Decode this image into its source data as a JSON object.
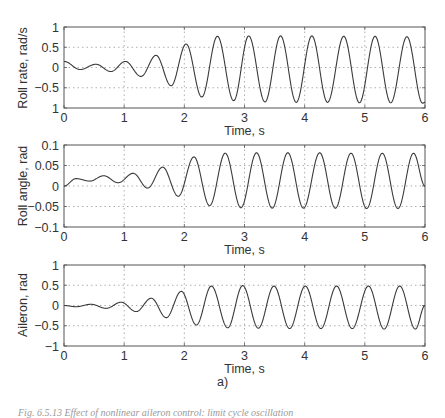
{
  "figure": {
    "subfigure_label": "a)",
    "caption": "Fig. 6.5.13 Effect of nonlinear aileron control: limit cycle oscillation"
  },
  "chart_data": [
    {
      "type": "line",
      "title": "",
      "xlabel": "Time, s",
      "ylabel": "Roll rate, rad/s",
      "xlim": [
        0,
        6
      ],
      "ylim": [
        -1,
        1
      ],
      "xticks": [
        "0",
        "1",
        "2",
        "3",
        "4",
        "5",
        "6"
      ],
      "yticks": [
        "1",
        "0.5",
        "0",
        "−0.5",
        "1"
      ],
      "ytick_values": [
        1,
        0.5,
        0,
        -0.5,
        -1
      ],
      "grid": true,
      "series": [
        {
          "name": "Roll rate",
          "extrema_t": [
            0,
            0.27,
            0.53,
            0.78,
            1.02,
            1.28,
            1.53,
            1.78,
            2.03,
            2.29,
            2.55,
            2.82,
            3.07,
            3.34,
            3.6,
            3.86,
            4.12,
            4.38,
            4.65,
            4.91,
            5.17,
            5.43,
            5.7,
            5.96,
            6.0
          ],
          "extrema_v": [
            0.15,
            -0.05,
            0.08,
            -0.1,
            0.15,
            -0.22,
            0.3,
            -0.45,
            0.58,
            -0.73,
            0.77,
            -0.82,
            0.78,
            -0.85,
            0.78,
            -0.86,
            0.78,
            -0.86,
            0.77,
            -0.87,
            0.77,
            -0.87,
            0.76,
            -0.88,
            -0.86
          ]
        }
      ]
    },
    {
      "type": "line",
      "title": "",
      "xlabel": "Time, s",
      "ylabel": "Roll angle, rad",
      "xlim": [
        0,
        6
      ],
      "ylim": [
        -0.1,
        0.1
      ],
      "xticks": [
        "0",
        "1",
        "2",
        "3",
        "4",
        "5",
        "6"
      ],
      "yticks": [
        "0.1",
        "0.05",
        "0",
        "−0.05",
        "−0.1"
      ],
      "ytick_values": [
        0.1,
        0.05,
        0,
        -0.05,
        -0.1
      ],
      "grid": true,
      "series": [
        {
          "name": "Roll angle",
          "extrema_t": [
            0,
            0.2,
            0.43,
            0.66,
            0.9,
            1.15,
            1.39,
            1.64,
            1.9,
            2.16,
            2.42,
            2.68,
            2.94,
            3.2,
            3.46,
            3.72,
            3.98,
            4.25,
            4.51,
            4.77,
            5.03,
            5.29,
            5.55,
            5.81,
            6.0
          ],
          "extrema_v": [
            0.0,
            0.018,
            0.012,
            0.025,
            0.008,
            0.031,
            -0.005,
            0.046,
            -0.025,
            0.071,
            -0.048,
            0.08,
            -0.053,
            0.081,
            -0.054,
            0.081,
            -0.054,
            0.081,
            -0.054,
            0.08,
            -0.055,
            0.08,
            -0.055,
            0.08,
            0.0
          ]
        }
      ]
    },
    {
      "type": "line",
      "title": "",
      "xlabel": "Time, s",
      "ylabel": "Aileron, rad",
      "xlim": [
        0,
        6
      ],
      "ylim": [
        -1,
        1
      ],
      "xticks": [
        "0",
        "1",
        "2",
        "3",
        "4",
        "5",
        "6"
      ],
      "yticks": [
        "1",
        "0.5",
        "0",
        "−0.5",
        "−1"
      ],
      "ytick_values": [
        1,
        0.5,
        0,
        -0.5,
        -1
      ],
      "grid": true,
      "series": [
        {
          "name": "Aileron",
          "extrema_t": [
            0,
            0.2,
            0.45,
            0.7,
            0.95,
            1.2,
            1.45,
            1.7,
            1.95,
            2.2,
            2.45,
            2.72,
            2.97,
            3.23,
            3.49,
            3.75,
            4.01,
            4.27,
            4.53,
            4.79,
            5.06,
            5.32,
            5.58,
            5.84,
            6.0
          ],
          "extrema_v": [
            0.0,
            -0.03,
            0.03,
            -0.07,
            0.08,
            -0.15,
            0.18,
            -0.3,
            0.35,
            -0.48,
            0.48,
            -0.55,
            0.49,
            -0.56,
            0.48,
            -0.57,
            0.48,
            -0.57,
            0.48,
            -0.57,
            0.48,
            -0.58,
            0.48,
            -0.58,
            0.0
          ]
        }
      ]
    }
  ],
  "style": {
    "line_color": "#3a3a3a",
    "axis_color": "#555555",
    "grid_color": "#9a9a9a"
  }
}
